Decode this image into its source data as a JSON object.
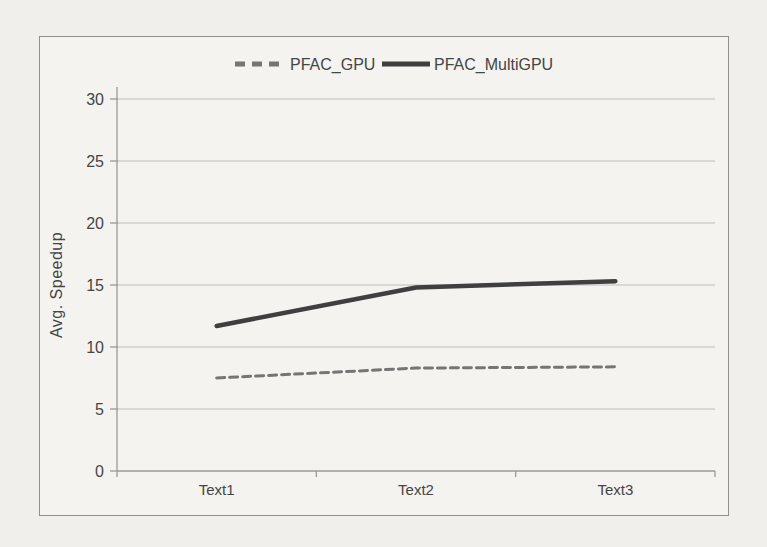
{
  "page": {
    "background": "#f0efec"
  },
  "chart": {
    "panel_background": "#f4f3f0",
    "panel_border_color": "#8f8f8f",
    "gridline_color": "#bdbdbd",
    "axis_color": "#9a9a9a",
    "text_color": "#454545"
  },
  "chart_data": {
    "type": "line",
    "title": "",
    "xlabel": "",
    "ylabel": "Avg. Speedup",
    "categories": [
      "Text1",
      "Text2",
      "Text3"
    ],
    "series": [
      {
        "name": "PFAC_GPU",
        "values": [
          7.5,
          8.3,
          8.4
        ],
        "color": "#757575",
        "style": "dashed",
        "stroke_width": 3
      },
      {
        "name": "PFAC_MultiGPU",
        "values": [
          11.7,
          14.8,
          15.3
        ],
        "color": "#3f3f3f",
        "style": "solid",
        "stroke_width": 4.5
      }
    ],
    "ylim": [
      0,
      30
    ],
    "yticks": [
      0,
      5,
      10,
      15,
      20,
      25,
      30
    ],
    "grid": true,
    "legend_position": "top-center"
  }
}
